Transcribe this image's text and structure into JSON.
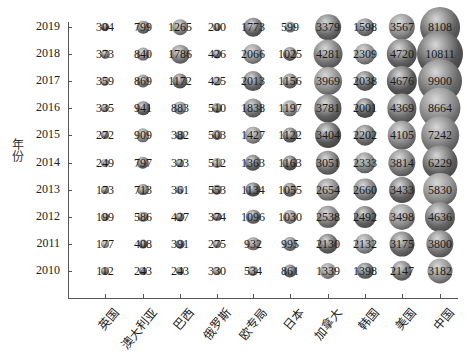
{
  "chart_data": {
    "type": "scatter",
    "subtype": "bubble",
    "title": "",
    "xlabel": "",
    "ylabel": "年份",
    "categories": [
      "英国",
      "澳大利亚",
      "巴西",
      "俄罗斯",
      "欧专局",
      "日本",
      "加拿大",
      "韩国",
      "美国",
      "中国"
    ],
    "years": [
      2019,
      2018,
      2017,
      2016,
      2015,
      2014,
      2013,
      2012,
      2011,
      2010
    ],
    "series": [
      {
        "name": "英国",
        "values": [
          304,
          373,
          359,
          335,
          272,
          249,
          173,
          199,
          177,
          112
        ]
      },
      {
        "name": "澳大利亚",
        "values": [
          799,
          840,
          869,
          941,
          909,
          797,
          713,
          586,
          408,
          243
        ]
      },
      {
        "name": "巴西",
        "values": [
          1265,
          1786,
          1172,
          883,
          382,
          323,
          361,
          427,
          391,
          243
        ]
      },
      {
        "name": "俄罗斯",
        "values": [
          200,
          426,
          425,
          510,
          503,
          512,
          553,
          374,
          275,
          330
        ]
      },
      {
        "name": "欧专局",
        "values": [
          1773,
          2066,
          2013,
          1838,
          1427,
          1363,
          1134,
          1096,
          932,
          534
        ]
      },
      {
        "name": "日本",
        "values": [
          599,
          1025,
          1156,
          1197,
          1122,
          1163,
          1055,
          1030,
          995,
          861
        ]
      },
      {
        "name": "加拿大",
        "values": [
          3379,
          4281,
          3969,
          3781,
          3404,
          3051,
          2654,
          2538,
          2130,
          1339
        ]
      },
      {
        "name": "韩国",
        "values": [
          1598,
          2309,
          2038,
          2001,
          2202,
          2333,
          2660,
          2492,
          2132,
          1398
        ]
      },
      {
        "name": "美国",
        "values": [
          3567,
          4720,
          4676,
          4369,
          4105,
          3814,
          3433,
          3498,
          3175,
          2147
        ]
      },
      {
        "name": "中国",
        "values": [
          8108,
          10811,
          9900,
          8664,
          7242,
          6229,
          5830,
          4636,
          3800,
          3182
        ]
      }
    ],
    "grid": false,
    "legend": "none"
  }
}
